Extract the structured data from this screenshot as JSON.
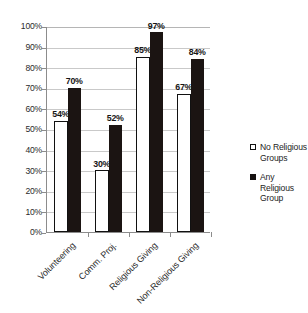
{
  "chart_data": {
    "type": "bar",
    "title": "",
    "subtitle": "",
    "xlabel": "",
    "ylabel": "",
    "ylim": [
      0,
      100
    ],
    "ytick_step": 10,
    "ytick_labels": [
      "0%",
      "10%",
      "20%",
      "30%",
      "40%",
      "50%",
      "60%",
      "70%",
      "80%",
      "90%",
      "100%"
    ],
    "ytick_values": [
      0,
      10,
      20,
      30,
      40,
      50,
      60,
      70,
      80,
      90,
      100
    ],
    "grid": "horizontal",
    "legend_position": "right",
    "value_suffix": "%",
    "categories": [
      "Volunteering",
      "Comm. Proj.",
      "Religious Giving",
      "Non-Religious Giving"
    ],
    "series": [
      {
        "name": "No Religious Groups",
        "color": "#ffffff",
        "edge_color": "#111111",
        "values": [
          54,
          30,
          85,
          67
        ],
        "labels": [
          "54%",
          "30%",
          "85%",
          "67%"
        ]
      },
      {
        "name": "Any Religious Group",
        "color": "#1b1412",
        "edge_color": "#1b1412",
        "values": [
          70,
          52,
          97,
          84
        ],
        "labels": [
          "70%",
          "52%",
          "97%",
          "84%"
        ]
      }
    ]
  },
  "legend": {
    "entries": [
      {
        "label": "No Religious Groups",
        "swatch": "legend-swatch-hollow"
      },
      {
        "label": "Any Religious Group",
        "swatch": "legend-swatch-filled"
      }
    ]
  },
  "colors": {
    "background": "#ffffff",
    "gridline": "#c9c9c9",
    "axis": "#8c8c8c",
    "text": "#1d1d1d"
  }
}
